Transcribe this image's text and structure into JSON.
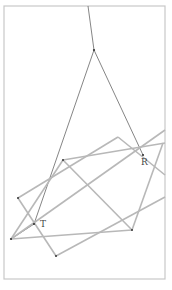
{
  "diagram": {
    "type": "geometric-construction",
    "frame": {
      "x": 4,
      "y": 6,
      "width": 161,
      "height": 273,
      "stroke": "#c8c8c8"
    },
    "colors": {
      "thin_line": "#555555",
      "thick_line": "#b4b4b4",
      "point": "#333333"
    },
    "labels": [
      {
        "id": "R",
        "text": "R",
        "x": 141,
        "y": 158
      },
      {
        "id": "T",
        "text": "T",
        "x": 40,
        "y": 222
      }
    ],
    "points": [
      {
        "name": "apex",
        "x": 94,
        "y": 50
      },
      {
        "name": "R",
        "x": 143,
        "y": 155
      },
      {
        "name": "T",
        "x": 34,
        "y": 224
      },
      {
        "name": "left-vertex",
        "x": 11,
        "y": 239
      },
      {
        "name": "P1",
        "x": 63,
        "y": 160
      },
      {
        "name": "P2",
        "x": 132,
        "y": 230
      },
      {
        "name": "P3",
        "x": 118,
        "y": 137
      },
      {
        "name": "P4",
        "x": 18,
        "y": 198
      },
      {
        "name": "P5",
        "x": 56,
        "y": 256
      },
      {
        "name": "P6",
        "x": 163,
        "y": 143
      }
    ]
  }
}
